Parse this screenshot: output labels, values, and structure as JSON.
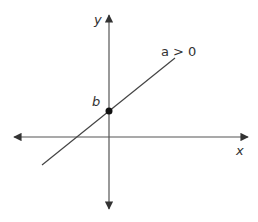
{
  "diagram": {
    "axes": {
      "x_label": "x",
      "y_label": "y"
    },
    "line": {
      "label": "a > 0",
      "slope_sign": "positive"
    },
    "intercept": {
      "label": "b",
      "description": "y-intercept point"
    },
    "colors": {
      "stroke": "#333333",
      "point": "#111111",
      "background": "#ffffff"
    }
  }
}
